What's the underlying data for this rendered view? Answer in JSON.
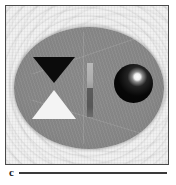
{
  "figure": {
    "panel_label": "c",
    "width_px": 176,
    "height_px": 185,
    "background_color": "#ffffff"
  },
  "frame": {
    "name": "image-frame",
    "border_color": "#4a4a4a",
    "field_color": "#f1f1f1",
    "left_px": 5,
    "top_px": 5,
    "width_px": 164,
    "height_px": 160
  },
  "image_content": {
    "modality_note": "grayscale reconstructed phantom image",
    "background_artifacts": "arc-shaped ringing / moire ripples",
    "phantom": {
      "name": "phantom-ellipse",
      "shape": "ellipse",
      "fill_color": "#888888",
      "center_x_px": 88,
      "center_y_px": 88,
      "radius_x_px": 75,
      "radius_y_px": 61
    },
    "inclusions": [
      {
        "name": "triangle-dark",
        "shape": "triangle-down",
        "fill_color": "#0b0b0b",
        "center_x_px": 50,
        "center_y_px": 70,
        "width_px": 42,
        "height_px": 26
      },
      {
        "name": "triangle-light",
        "shape": "triangle-up",
        "fill_color": "#f4f4f4",
        "center_x_px": 50,
        "center_y_px": 103,
        "width_px": 44,
        "height_px": 29
      },
      {
        "name": "bar-upper",
        "shape": "vertical-bar",
        "fill_color": "#b0b0b0",
        "center_x_px": 89,
        "center_y_px": 75,
        "width_px": 6,
        "height_px": 25
      },
      {
        "name": "bar-lower",
        "shape": "vertical-bar",
        "fill_color": "#585858",
        "center_x_px": 89,
        "center_y_px": 102,
        "width_px": 6,
        "height_px": 29
      },
      {
        "name": "sphere-dark",
        "shape": "circle",
        "fill_color": "#060606",
        "highlight_color": "#ffffff",
        "center_x_px": 133,
        "center_y_px": 83,
        "radius_px": 19
      }
    ]
  },
  "caption": {
    "label": "c",
    "rule_color": "#3a3a3a"
  }
}
